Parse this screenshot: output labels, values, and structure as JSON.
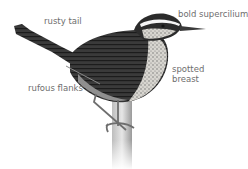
{
  "figure": {
    "labels": {
      "tail": "rusty tail",
      "supercilium": "bold supercilium",
      "breast_line1": "spotted",
      "breast_line2": "breast",
      "flanks": "rufous flanks"
    }
  }
}
